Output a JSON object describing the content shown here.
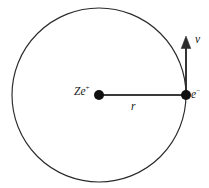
{
  "diagram": {
    "background_color": "#ffffff",
    "stroke_color": "#2b2b2b",
    "labels": {
      "nucleus_charge": "Ze",
      "nucleus_charge_sign": "+",
      "electron": "e",
      "electron_charge_sign": "−",
      "radius": "r",
      "velocity": "v"
    },
    "geometry": {
      "orbit_center_x": 99,
      "orbit_center_y": 95,
      "orbit_radius": 87,
      "nucleus_dot_x": 99,
      "nucleus_dot_y": 95,
      "nucleus_dot_radius": 5,
      "electron_dot_x": 186,
      "electron_dot_y": 95,
      "electron_dot_radius": 5,
      "radius_line_x1": 99,
      "radius_line_y1": 95,
      "radius_line_x2": 186,
      "radius_line_y2": 95,
      "velocity_arrow_x": 186,
      "velocity_arrow_y_tail": 95,
      "velocity_arrow_y_head": 38
    }
  }
}
